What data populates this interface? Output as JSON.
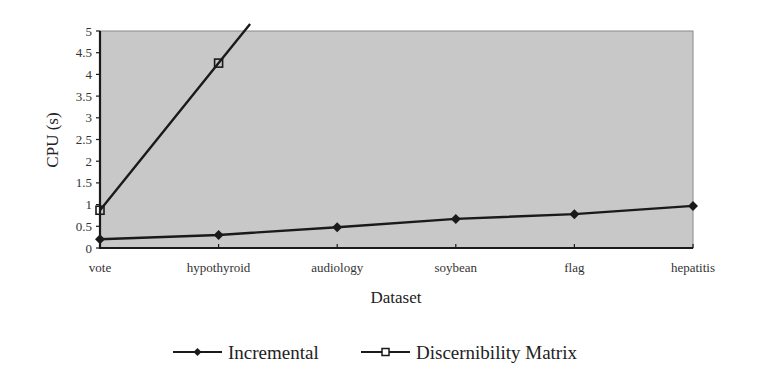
{
  "chart_data": {
    "type": "line",
    "title": "",
    "xlabel": "Dataset",
    "ylabel": "CPU (s)",
    "categories": [
      "vote",
      "hypothyroid",
      "audiology",
      "soybean",
      "flag",
      "hepatitis"
    ],
    "ylim": [
      0,
      5
    ],
    "yticks": [
      "0",
      "0.5",
      "1",
      "1.5",
      "2",
      "2.5",
      "3",
      "3.5",
      "4",
      "4.5",
      "5"
    ],
    "grid": false,
    "legend_position": "bottom",
    "plot_background": "#c8c8c8",
    "series": [
      {
        "name": "Incremental",
        "marker": "filled-diamond",
        "color": "#1a1a1a",
        "values": [
          0.2,
          0.3,
          0.48,
          0.67,
          0.78,
          0.97
        ]
      },
      {
        "name": "Discernibility Matrix",
        "marker": "open-square",
        "color": "#1a1a1a",
        "values": [
          0.87,
          4.26,
          null,
          null,
          null,
          null
        ],
        "note": "line continues above 5 between hypothyroid and audiology (clipped)"
      }
    ]
  },
  "legend": {
    "items": [
      {
        "label": "Incremental"
      },
      {
        "label": "Discernibility Matrix"
      }
    ]
  }
}
